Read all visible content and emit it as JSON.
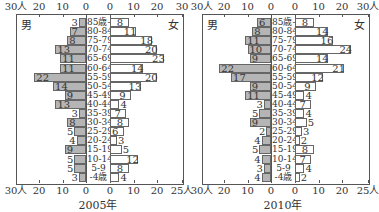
{
  "chart_data": [
    {
      "type": "bar",
      "subtype": "population-pyramid",
      "title": "2005年",
      "left_label": "男",
      "right_label": "女",
      "categories": [
        "85歳-",
        "80-84",
        "75-79",
        "70-74",
        "65-69",
        "60-64",
        "55-59",
        "50-54",
        "45-49",
        "40-44",
        "35-39",
        "30-34",
        "25-29",
        "20-24",
        "15-19",
        "10-14",
        "5-9",
        "-4歳"
      ],
      "series": [
        {
          "name": "男",
          "values": [
            3,
            7,
            8,
            13,
            11,
            11,
            22,
            14,
            9,
            13,
            3,
            8,
            5,
            4,
            9,
            5,
            5,
            3
          ]
        },
        {
          "name": "女",
          "values": [
            8,
            11,
            18,
            20,
            23,
            14,
            20,
            13,
            9,
            4,
            7,
            8,
            6,
            3,
            5,
            12,
            8,
            4
          ]
        }
      ],
      "axis_top_left": [
        "30人",
        "20",
        "10",
        "0"
      ],
      "axis_top_right": [
        "0",
        "10",
        "20",
        "30"
      ],
      "axis_bottom_left": [
        "30人",
        "20",
        "10",
        "0"
      ],
      "axis_bottom_right": [
        "0",
        "10",
        "20",
        "25人"
      ],
      "xlim_male": [
        0,
        30
      ],
      "xlim_female": [
        0,
        30
      ]
    },
    {
      "type": "bar",
      "subtype": "population-pyramid",
      "title": "2010年",
      "left_label": "男",
      "right_label": "女",
      "categories": [
        "85歳-",
        "80-84",
        "75-79",
        "70-74",
        "65-69",
        "60-64",
        "55-59",
        "50-54",
        "45-49",
        "40-44",
        "35-39",
        "30-34",
        "25-29",
        "20-24",
        "15-19",
        "10-14",
        "5-9",
        "-4歳"
      ],
      "series": [
        {
          "name": "男",
          "values": [
            6,
            8,
            11,
            10,
            9,
            22,
            17,
            9,
            11,
            3,
            5,
            9,
            2,
            4,
            5,
            4,
            3,
            4
          ]
        },
        {
          "name": "女",
          "values": [
            8,
            14,
            16,
            24,
            14,
            21,
            12,
            9,
            4,
            7,
            4,
            5,
            3,
            2,
            8,
            7,
            4,
            2
          ]
        }
      ],
      "axis_top_left": [
        "30人",
        "20",
        "10",
        "0"
      ],
      "axis_top_right": [
        "0",
        "10",
        "20",
        "30人"
      ],
      "axis_bottom_left": [
        "30人",
        "20",
        "10",
        "0"
      ],
      "axis_bottom_right": [
        "0",
        "10",
        "20",
        "25人"
      ],
      "xlim_male": [
        0,
        30
      ],
      "xlim_female": [
        0,
        30
      ]
    }
  ],
  "colors": {
    "male_bar": "#b5b5b5",
    "female_bar": "#ffffff",
    "border": "#666666"
  }
}
